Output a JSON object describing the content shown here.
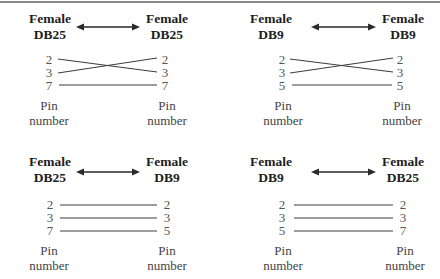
{
  "figure": {
    "panels": [
      {
        "left": {
          "gender": "Female",
          "connector": "DB25"
        },
        "right": {
          "gender": "Female",
          "connector": "DB25"
        },
        "left_pins": [
          "2",
          "3",
          "7"
        ],
        "right_pins": [
          "2",
          "3",
          "7"
        ],
        "wiring": [
          [
            0,
            1
          ],
          [
            1,
            0
          ],
          [
            2,
            2
          ]
        ],
        "left_caption": [
          "Pin",
          "number"
        ],
        "right_caption": [
          "Pin",
          "number"
        ]
      },
      {
        "left": {
          "gender": "Female",
          "connector": "DB9"
        },
        "right": {
          "gender": "Female",
          "connector": "DB9"
        },
        "left_pins": [
          "2",
          "3",
          "5"
        ],
        "right_pins": [
          "2",
          "3",
          "5"
        ],
        "wiring": [
          [
            0,
            1
          ],
          [
            1,
            0
          ],
          [
            2,
            2
          ]
        ],
        "left_caption": [
          "Pin",
          "number"
        ],
        "right_caption": [
          "Pin",
          "number"
        ]
      },
      {
        "left": {
          "gender": "Female",
          "connector": "DB25"
        },
        "right": {
          "gender": "Female",
          "connector": "DB9"
        },
        "left_pins": [
          "2",
          "3",
          "7"
        ],
        "right_pins": [
          "2",
          "3",
          "5"
        ],
        "wiring": [
          [
            0,
            0
          ],
          [
            1,
            1
          ],
          [
            2,
            2
          ]
        ],
        "left_caption": [
          "Pin",
          "number"
        ],
        "right_caption": [
          "Pin",
          "number"
        ]
      },
      {
        "left": {
          "gender": "Female",
          "connector": "DB9"
        },
        "right": {
          "gender": "Female",
          "connector": "DB25"
        },
        "left_pins": [
          "2",
          "3",
          "5"
        ],
        "right_pins": [
          "2",
          "3",
          "7"
        ],
        "wiring": [
          [
            0,
            0
          ],
          [
            1,
            1
          ],
          [
            2,
            2
          ]
        ],
        "left_caption": [
          "Pin",
          "number"
        ],
        "right_caption": [
          "Pin",
          "number"
        ]
      }
    ],
    "colors": {
      "line": "#3a3a3a",
      "rule": "#8a8a8a"
    }
  }
}
